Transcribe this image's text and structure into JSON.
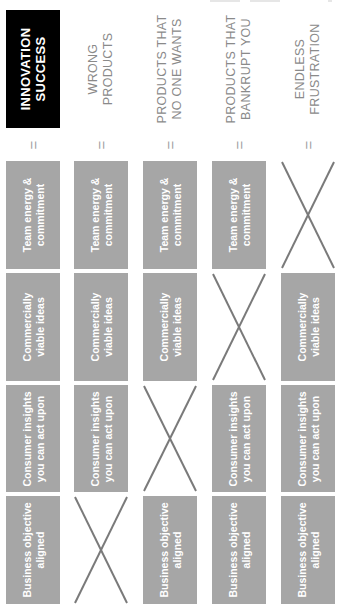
{
  "orientation": "rotated-90-ccw",
  "colors": {
    "success_header_bg": "#000000",
    "success_header_text": "#ffffff",
    "fail_header_text": "#8a8a8a",
    "box_bg": "#a6a6a6",
    "box_text": "#ffffff",
    "cross_line": "#7a7a7a",
    "equals": "#a0a0a0"
  },
  "equals_symbol": "=",
  "factors": {
    "team": "Team energy & commitment",
    "commercial": "Commercially viable ideas",
    "consumer": "Consumer insights you can act upon",
    "business": "Business objective aligned"
  },
  "columns": [
    {
      "outcome": [
        "INNOVATION",
        "SUCCESS"
      ],
      "style": "success",
      "team": {
        "present": true,
        "lines": [
          "Team energy &",
          "commitment"
        ]
      },
      "commercial": {
        "present": true,
        "lines": [
          "Commercially",
          "viable ideas"
        ]
      },
      "consumer": {
        "present": true,
        "lines": [
          "Consumer insights",
          "you can act upon"
        ]
      },
      "business": {
        "present": true,
        "lines": [
          "Business objective",
          "aligned"
        ]
      }
    },
    {
      "outcome": [
        "WRONG",
        "PRODUCTS"
      ],
      "style": "fail",
      "team": {
        "present": true,
        "lines": [
          "Team energy &",
          "commitment"
        ]
      },
      "commercial": {
        "present": true,
        "lines": [
          "Commercially",
          "viable ideas"
        ]
      },
      "consumer": {
        "present": true,
        "lines": [
          "Consumer insights",
          "you can act upon"
        ]
      },
      "business": {
        "present": false,
        "lines": [
          "",
          ""
        ]
      }
    },
    {
      "outcome": [
        "PRODUCTS THAT",
        "NO ONE WANTS"
      ],
      "style": "fail",
      "team": {
        "present": true,
        "lines": [
          "Team energy &",
          "commitment"
        ]
      },
      "commercial": {
        "present": true,
        "lines": [
          "Commercially",
          "viable ideas"
        ]
      },
      "consumer": {
        "present": false,
        "lines": [
          "",
          ""
        ]
      },
      "business": {
        "present": true,
        "lines": [
          "Business objective",
          "aligned"
        ]
      }
    },
    {
      "outcome": [
        "PRODUCTS THAT",
        "BANKRUPT YOU"
      ],
      "style": "fail",
      "team": {
        "present": true,
        "lines": [
          "Team energy &",
          "commitment"
        ]
      },
      "commercial": {
        "present": false,
        "lines": [
          "",
          ""
        ]
      },
      "consumer": {
        "present": true,
        "lines": [
          "Consumer insights",
          "you can act upon"
        ]
      },
      "business": {
        "present": true,
        "lines": [
          "Business objective",
          "aligned"
        ]
      }
    },
    {
      "outcome": [
        "ENDLESS",
        "FRUSTRATION"
      ],
      "style": "fail",
      "team": {
        "present": false,
        "lines": [
          "",
          ""
        ]
      },
      "commercial": {
        "present": true,
        "lines": [
          "Commercially",
          "viable ideas"
        ]
      },
      "consumer": {
        "present": true,
        "lines": [
          "Consumer insights",
          "you can act upon"
        ]
      },
      "business": {
        "present": true,
        "lines": [
          "Business objective",
          "aligned"
        ]
      }
    }
  ]
}
